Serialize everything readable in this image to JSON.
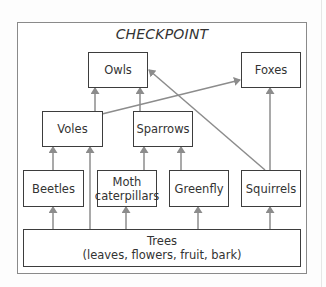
{
  "diagram": {
    "title": "CHECKPOINT",
    "type": "food-web",
    "nodes": {
      "owls": "Owls",
      "foxes": "Foxes",
      "voles": "Voles",
      "sparrows": "Sparrows",
      "beetles": "Beetles",
      "moth_line1": "Moth",
      "moth_line2": "caterpillars",
      "greenfly": "Greenfly",
      "squirrels": "Squirrels",
      "trees_line1": "Trees",
      "trees_line2": "(leaves, flowers, fruit, bark)"
    },
    "edges": [
      {
        "from": "Trees",
        "to": "Beetles"
      },
      {
        "from": "Trees",
        "to": "Voles"
      },
      {
        "from": "Trees",
        "to": "Moth caterpillars"
      },
      {
        "from": "Trees",
        "to": "Greenfly"
      },
      {
        "from": "Trees",
        "to": "Squirrels"
      },
      {
        "from": "Beetles",
        "to": "Voles"
      },
      {
        "from": "Moth caterpillars",
        "to": "Sparrows"
      },
      {
        "from": "Greenfly",
        "to": "Sparrows"
      },
      {
        "from": "Voles",
        "to": "Owls"
      },
      {
        "from": "Voles",
        "to": "Foxes"
      },
      {
        "from": "Sparrows",
        "to": "Owls"
      },
      {
        "from": "Squirrels",
        "to": "Owls"
      },
      {
        "from": "Squirrels",
        "to": "Foxes"
      }
    ],
    "colors": {
      "arrow": "#8c8c8c",
      "box_border": "#3d3d3d",
      "frame": "#8a8a8a"
    }
  }
}
